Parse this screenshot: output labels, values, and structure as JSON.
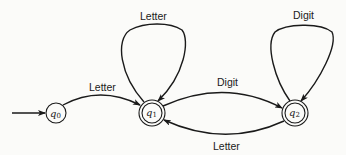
{
  "diagram": {
    "type": "finite-automaton",
    "states": [
      {
        "id": "q0",
        "name": "q",
        "sub": "0",
        "accepting": false,
        "start": true
      },
      {
        "id": "q1",
        "name": "q",
        "sub": "1",
        "accepting": true,
        "start": false
      },
      {
        "id": "q2",
        "name": "q",
        "sub": "2",
        "accepting": true,
        "start": false
      }
    ],
    "transitions": [
      {
        "from": "q0",
        "to": "q1",
        "label": "Letter"
      },
      {
        "from": "q1",
        "to": "q1",
        "label": "Letter"
      },
      {
        "from": "q1",
        "to": "q2",
        "label": "Digit"
      },
      {
        "from": "q2",
        "to": "q2",
        "label": "Digit"
      },
      {
        "from": "q2",
        "to": "q1",
        "label": "Letter"
      }
    ]
  }
}
